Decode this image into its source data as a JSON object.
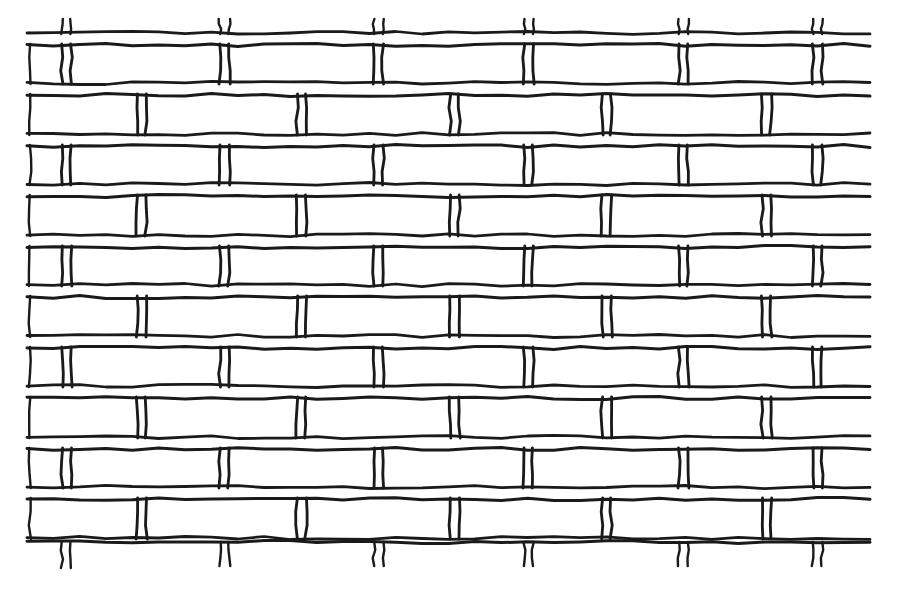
{
  "document": {
    "title": "Brick Wall Pattern",
    "subject": "hand-drawn running-bond brick wall",
    "medium": "ink line drawing on white paper",
    "header_text_fragment": "",
    "canvas": {
      "width": 903,
      "height": 594
    }
  },
  "palette": {
    "paper": "#ffffff",
    "ink": "#1a1a1a",
    "header_text": "#8e8e93"
  },
  "drawing": {
    "name": "brick-wall",
    "bond_pattern": "running bond (stretcher bond)",
    "stroke_width": 3.0,
    "stroke_width_light": 2.4,
    "wobble_amplitude": 1.6,
    "bounds": {
      "left": 28,
      "right": 868,
      "top": 31,
      "bottom": 566
    },
    "courses": {
      "count": 11,
      "pitch": 50.5,
      "mortar_gap": 12,
      "top_line_y": 33,
      "baselines": [
        33,
        45,
        83,
        95,
        134,
        146,
        184,
        196,
        235,
        247,
        285,
        297,
        336,
        348,
        386,
        398,
        437,
        449,
        487,
        499,
        538,
        542
      ]
    },
    "row_bands": [
      {
        "index": 0,
        "kind": "clipped-top",
        "top_y": 33,
        "bottom_y": 45,
        "joint_set": "A",
        "stub_extent": 14
      },
      {
        "index": 1,
        "kind": "full",
        "top_y": 45,
        "bottom_y": 83,
        "joint_set": "A"
      },
      {
        "index": 2,
        "kind": "full",
        "top_y": 95,
        "bottom_y": 134,
        "joint_set": "B"
      },
      {
        "index": 3,
        "kind": "full",
        "top_y": 146,
        "bottom_y": 184,
        "joint_set": "A"
      },
      {
        "index": 4,
        "kind": "full",
        "top_y": 196,
        "bottom_y": 235,
        "joint_set": "B"
      },
      {
        "index": 5,
        "kind": "full",
        "top_y": 247,
        "bottom_y": 285,
        "joint_set": "A"
      },
      {
        "index": 6,
        "kind": "full",
        "top_y": 297,
        "bottom_y": 336,
        "joint_set": "B"
      },
      {
        "index": 7,
        "kind": "full",
        "top_y": 348,
        "bottom_y": 386,
        "joint_set": "A"
      },
      {
        "index": 8,
        "kind": "full",
        "top_y": 398,
        "bottom_y": 437,
        "joint_set": "B"
      },
      {
        "index": 9,
        "kind": "full",
        "top_y": 449,
        "bottom_y": 487,
        "joint_set": "A"
      },
      {
        "index": 10,
        "kind": "full",
        "top_y": 499,
        "bottom_y": 538,
        "joint_set": "B"
      },
      {
        "index": 11,
        "kind": "clipped-bottom",
        "top_y": 538,
        "bottom_y": 566,
        "joint_set": "A",
        "stub_extent": 26
      }
    ],
    "joint_sets": {
      "A": {
        "label": "odd-course joints",
        "x": [
          62,
          220,
          374,
          524,
          679,
          813
        ]
      },
      "B": {
        "label": "even-course joints",
        "x": [
          137,
          297,
          450,
          602,
          762
        ]
      }
    },
    "joint_gap": 9,
    "edges": {
      "left_x": 28,
      "right_x": 868,
      "right_partial": true,
      "left_partial": true
    },
    "brick_counts": {
      "per_full_course_visible": 6,
      "total_visible_bricks": 64
    }
  }
}
